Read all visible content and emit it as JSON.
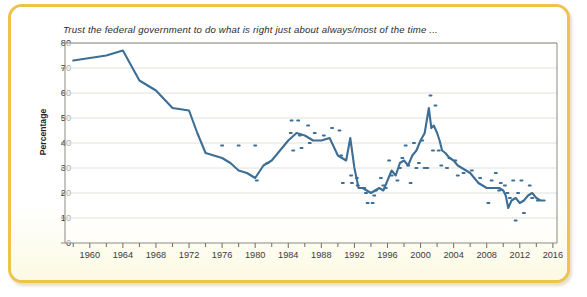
{
  "figure": {
    "border_color": "#f0c14b",
    "background_color": "#fdfcf3"
  },
  "chart_data": {
    "type": "line",
    "title": "Trust the federal government to do what is right just about always/most of the time ...",
    "xlabel": "",
    "ylabel": "Percentage",
    "xlim": [
      1957,
      2016.5
    ],
    "ylim": [
      0,
      80
    ],
    "grid": true,
    "legend_position": "none",
    "line_color": "#3d6e96",
    "marker_color": "#3d6e96",
    "ytick_labels": [
      "0",
      "10",
      "20",
      "30",
      "40",
      "50",
      "60",
      "70",
      "80"
    ],
    "ytick_values": [
      0,
      10,
      20,
      30,
      40,
      50,
      60,
      70,
      80
    ],
    "xtick_labels": [
      "1960",
      "1964",
      "1968",
      "1972",
      "1976",
      "1980",
      "1984",
      "1988",
      "1992",
      "1996",
      "2000",
      "2004",
      "2008",
      "2012",
      "2016"
    ],
    "xtick_values": [
      1960,
      1964,
      1968,
      1972,
      1976,
      1980,
      1984,
      1988,
      1992,
      1996,
      2000,
      2004,
      2008,
      2012,
      2016
    ],
    "xtick_minor_values": [
      1958,
      1962,
      1966,
      1970,
      1974,
      1978,
      1982,
      1986,
      1990,
      1994,
      1998,
      2002,
      2006,
      2010,
      2014
    ],
    "series": [
      {
        "name": "Trust in federal government (trend line)",
        "x": [
          1958,
          1960,
          1962,
          1964,
          1966,
          1968,
          1970,
          1972,
          1973,
          1974,
          1975,
          1976,
          1977,
          1978,
          1979,
          1980,
          1981,
          1982,
          1983,
          1984,
          1985,
          1986,
          1987,
          1988,
          1989,
          1990,
          1991,
          1991.5,
          1992,
          1992.5,
          1993,
          1993.5,
          1994,
          1994.5,
          1995,
          1995.5,
          1996,
          1996.5,
          1997,
          1997.5,
          1998,
          1998.5,
          1999,
          1999.5,
          2000,
          2000.5,
          2001,
          2001.3,
          2001.6,
          2002,
          2002.3,
          2002.6,
          2003,
          2003.5,
          2004,
          2004.5,
          2005,
          2005.5,
          2006,
          2006.5,
          2007,
          2007.5,
          2008,
          2008.5,
          2009,
          2009.5,
          2010,
          2010.3,
          2010.6,
          2011,
          2011.5,
          2012,
          2012.5,
          2013,
          2013.5,
          2014,
          2014.5,
          2015
        ],
        "y": [
          73,
          74,
          75,
          77,
          65,
          61,
          54,
          53,
          44,
          36,
          35,
          34,
          32,
          29,
          28,
          26,
          31,
          33,
          37,
          41,
          44,
          43,
          41,
          41,
          42,
          35,
          33,
          42,
          30,
          22,
          22,
          21,
          20,
          21,
          22,
          21,
          25,
          29,
          27,
          32,
          33,
          31,
          35,
          37,
          41,
          44,
          54,
          46,
          47,
          44,
          41,
          37,
          36,
          34,
          33,
          31,
          30,
          29,
          28,
          26,
          24,
          23,
          22,
          22,
          22,
          22,
          21,
          19,
          14,
          17,
          18,
          16,
          17,
          19,
          20,
          18,
          17,
          17
        ]
      }
    ],
    "scatter_points": {
      "name": "Individual poll readings",
      "x": [
        1976,
        1978,
        1980,
        1980.2,
        1981.5,
        1984.3,
        1984.4,
        1984.6,
        1985.2,
        1985.4,
        1985.6,
        1986.4,
        1986.6,
        1987.2,
        1988.3,
        1989.3,
        1990.2,
        1990.4,
        1990.6,
        1991.6,
        1991.7,
        1992.3,
        1992.4,
        1993.2,
        1993.4,
        1993.6,
        1994.2,
        1994.4,
        1994.6,
        1995.2,
        1995.5,
        1995.8,
        1996.2,
        1996.5,
        1997.2,
        1997.5,
        1997.8,
        1998.2,
        1998.5,
        1998.8,
        1999.2,
        1999.5,
        1999.8,
        2000.2,
        2000.5,
        2000.8,
        2001.2,
        2001.5,
        2001.8,
        2002.2,
        2002.5,
        2003.2,
        2003.5,
        2004.2,
        2004.5,
        2005.2,
        2006.2,
        2007.2,
        2008.2,
        2008.6,
        2009.1,
        2009.3,
        2009.5,
        2009.7,
        2010.2,
        2010.5,
        2010.8,
        2011.2,
        2011.5,
        2011.8,
        2012.2,
        2012.5,
        2013.2,
        2013.5,
        2014.2
      ],
      "y": [
        39,
        39,
        39,
        25,
        32,
        44,
        49,
        37,
        49,
        43,
        38,
        47,
        40,
        44,
        43,
        46,
        45,
        35,
        24,
        27,
        24,
        26,
        23,
        22,
        20,
        16,
        16,
        19,
        21,
        26,
        23,
        22,
        33,
        27,
        25,
        30,
        34,
        39,
        31,
        24,
        40,
        30,
        32,
        41,
        30,
        30,
        59,
        37,
        55,
        37,
        31,
        30,
        34,
        33,
        27,
        28,
        29,
        26,
        16,
        25,
        28,
        22,
        21,
        24,
        23,
        20,
        18,
        25,
        9,
        20,
        25,
        12,
        23,
        18,
        17
      ]
    }
  }
}
